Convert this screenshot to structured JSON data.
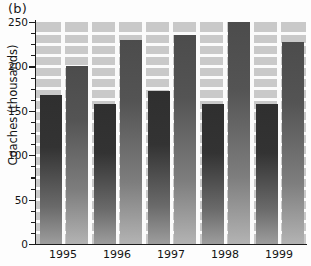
{
  "figure": {
    "panel_label": "(b)"
  },
  "chart_data": {
    "type": "bar",
    "title": "",
    "panel": "(b)",
    "xlabel": "",
    "ylabel": "Coaches (thousands)",
    "categories": [
      "1995",
      "1996",
      "1997",
      "1998",
      "1999"
    ],
    "series": [
      {
        "name": "dark-bar",
        "values": [
          168,
          158,
          172,
          158,
          158
        ]
      },
      {
        "name": "light-bar",
        "values": [
          200,
          230,
          235,
          250,
          228
        ]
      }
    ],
    "ylim": [
      0,
      250
    ],
    "ytick_labels": [
      "0",
      "50",
      "100",
      "150",
      "200",
      "250"
    ],
    "ytick_values": [
      0,
      50,
      100,
      150,
      200,
      250
    ],
    "yminor_step": 12.5,
    "grid": true,
    "legend": "none",
    "colors": {
      "plot_background": "#c9c9c9",
      "gridline": "#fbfbfb",
      "dark_bar": "#2f2f2f",
      "light_bar": "#4c4c4c",
      "axis": "#1c1c1c",
      "text": "#141414"
    }
  }
}
